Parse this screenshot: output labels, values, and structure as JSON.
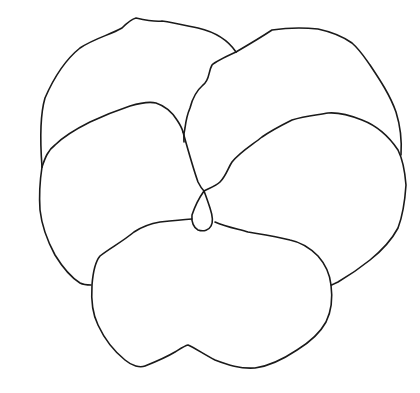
{
  "figure": {
    "style": "black outline on white background",
    "stroke_color": "#1a1a1a",
    "background_color": "#ffffff",
    "petals": [
      {
        "name": "top-left-petal"
      },
      {
        "name": "top-right-petal"
      },
      {
        "name": "middle-left-petal"
      },
      {
        "name": "middle-right-petal"
      },
      {
        "name": "bottom-petal"
      },
      {
        "name": "center-loop"
      }
    ]
  }
}
